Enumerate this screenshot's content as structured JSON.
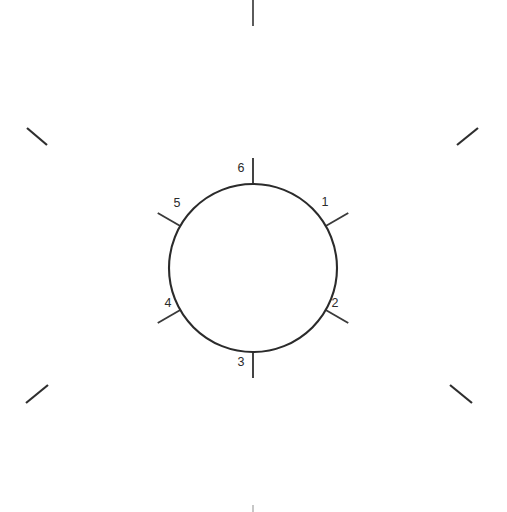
{
  "figure": {
    "background_color": "#ffffff",
    "line_color": "#2b2b2b",
    "width": 507,
    "height": 512
  },
  "circle": {
    "name": "reference-circle",
    "center_x": 253,
    "center_y": 268,
    "radius": 84,
    "stroke_color": "#2b2b2b",
    "stroke_width": 2.1
  },
  "radial_ticks": [
    {
      "label": "1",
      "angle_deg": 30,
      "inner_radius": 84,
      "outer_radius": 110,
      "label_x": 325,
      "label_y": 203
    },
    {
      "label": "2",
      "angle_deg": 330,
      "inner_radius": 84,
      "outer_radius": 110,
      "label_x": 335,
      "label_y": 304
    },
    {
      "label": "3",
      "angle_deg": 270,
      "inner_radius": 84,
      "outer_radius": 110,
      "label_x": 241,
      "label_y": 363
    },
    {
      "label": "4",
      "angle_deg": 210,
      "inner_radius": 84,
      "outer_radius": 110,
      "label_x": 168,
      "label_y": 304
    },
    {
      "label": "5",
      "angle_deg": 150,
      "inner_radius": 84,
      "outer_radius": 110,
      "label_x": 177,
      "label_y": 204
    },
    {
      "label": "6",
      "angle_deg": 90,
      "inner_radius": 84,
      "outer_radius": 110,
      "label_x": 241,
      "label_y": 169
    }
  ],
  "corner_marks": [
    {
      "name": "corner-mark-top-left",
      "x1": 27,
      "y1": 128,
      "x2": 47,
      "y2": 145
    },
    {
      "name": "corner-mark-top-right",
      "x1": 457,
      "y1": 145,
      "x2": 478,
      "y2": 128
    },
    {
      "name": "corner-mark-bottom-left",
      "x1": 26,
      "y1": 403,
      "x2": 48,
      "y2": 385
    },
    {
      "name": "corner-mark-bottom-right",
      "x1": 450,
      "y1": 385,
      "x2": 472,
      "y2": 403
    }
  ],
  "edge_marks": [
    {
      "name": "edge-mark-top",
      "x1": 253,
      "y1": 0,
      "x2": 253,
      "y2": 26,
      "faint": false
    },
    {
      "name": "edge-mark-bottom",
      "x1": 253,
      "y1": 505,
      "x2": 253,
      "y2": 512,
      "faint": true
    }
  ]
}
